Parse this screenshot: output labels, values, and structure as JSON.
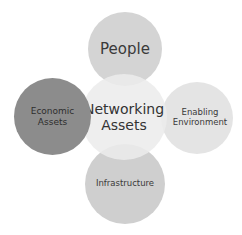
{
  "diagram": {
    "type": "radial-venn",
    "center": {
      "id": "networking",
      "label_line1": "Networking",
      "label_line2": "Assets",
      "color": "#ebebeb",
      "cx": 124,
      "cy": 117,
      "r": 43
    },
    "nodes": [
      {
        "id": "people",
        "label_line1": "People",
        "label_line2": "",
        "color": "#d4d4d4",
        "cx": 125,
        "cy": 49,
        "r": 37
      },
      {
        "id": "economic",
        "label_line1": "Economic",
        "label_line2": "Assets",
        "color": "#8c8c8c",
        "cx": 52,
        "cy": 116,
        "r": 38
      },
      {
        "id": "enabling",
        "label_line1": "Enabling",
        "label_line2": "Environment",
        "color": "#e4e4e4",
        "cx": 197,
        "cy": 118,
        "r": 36
      },
      {
        "id": "infrastructure",
        "label_line1": "Infrastructure",
        "label_line2": "",
        "color": "#cfcfcf",
        "cx": 125,
        "cy": 184,
        "r": 40
      }
    ],
    "text_color": "#3a3a3a"
  }
}
